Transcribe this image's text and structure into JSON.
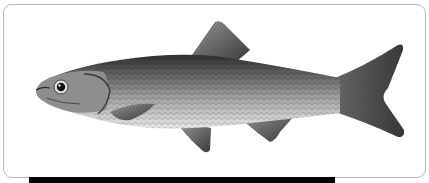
{
  "image": {
    "subject": "fish-illustration",
    "style": "grayscale scientific illustration",
    "alt": "Side view illustration of a fish"
  },
  "colors": {
    "background": "#ffffff",
    "frame_border": "#b8b8b8",
    "bar": "#000000",
    "body_dark": "#3a3a3a",
    "body_mid": "#8a8a8a",
    "body_light": "#d4d4d4",
    "fin": "#5a5a5a"
  }
}
